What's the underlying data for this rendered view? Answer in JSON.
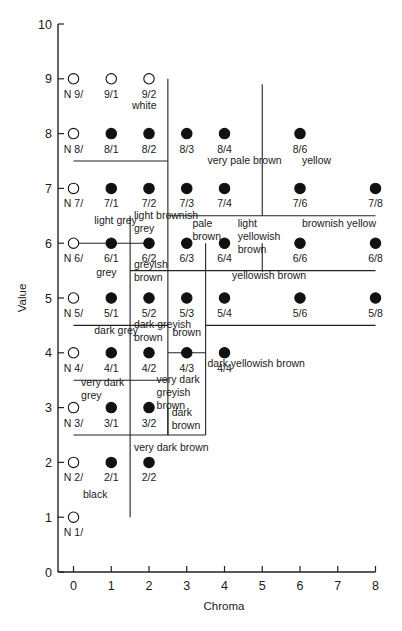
{
  "chart_data": {
    "type": "scatter",
    "title": "",
    "xlabel": "Chroma",
    "ylabel": "Value",
    "xlim": [
      0,
      8
    ],
    "ylim": [
      0,
      10
    ],
    "x_ticks": [
      0,
      1,
      2,
      3,
      4,
      5,
      6,
      7,
      8
    ],
    "y_ticks": [
      0,
      1,
      2,
      3,
      4,
      5,
      6,
      7,
      8,
      9,
      10
    ],
    "grid": false,
    "legend": null,
    "points": [
      {
        "label": "N 9/",
        "chroma": 0,
        "value": 9,
        "filled": false
      },
      {
        "label": "9/1",
        "chroma": 1,
        "value": 9,
        "filled": false
      },
      {
        "label": "9/2",
        "chroma": 2,
        "value": 9,
        "filled": false
      },
      {
        "label": "N 8/",
        "chroma": 0,
        "value": 8,
        "filled": false
      },
      {
        "label": "8/1",
        "chroma": 1,
        "value": 8,
        "filled": true
      },
      {
        "label": "8/2",
        "chroma": 2,
        "value": 8,
        "filled": true
      },
      {
        "label": "8/3",
        "chroma": 3,
        "value": 8,
        "filled": true
      },
      {
        "label": "8/4",
        "chroma": 4,
        "value": 8,
        "filled": true
      },
      {
        "label": "8/6",
        "chroma": 6,
        "value": 8,
        "filled": true
      },
      {
        "label": "N 7/",
        "chroma": 0,
        "value": 7,
        "filled": false
      },
      {
        "label": "7/1",
        "chroma": 1,
        "value": 7,
        "filled": true
      },
      {
        "label": "7/2",
        "chroma": 2,
        "value": 7,
        "filled": true
      },
      {
        "label": "7/3",
        "chroma": 3,
        "value": 7,
        "filled": true
      },
      {
        "label": "7/4",
        "chroma": 4,
        "value": 7,
        "filled": true
      },
      {
        "label": "7/6",
        "chroma": 6,
        "value": 7,
        "filled": true
      },
      {
        "label": "7/8",
        "chroma": 8,
        "value": 7,
        "filled": true
      },
      {
        "label": "N 6/",
        "chroma": 0,
        "value": 6,
        "filled": false
      },
      {
        "label": "6/1",
        "chroma": 1,
        "value": 6,
        "filled": true
      },
      {
        "label": "6/2",
        "chroma": 2,
        "value": 6,
        "filled": true
      },
      {
        "label": "6/3",
        "chroma": 3,
        "value": 6,
        "filled": true
      },
      {
        "label": "6/4",
        "chroma": 4,
        "value": 6,
        "filled": true
      },
      {
        "label": "6/6",
        "chroma": 6,
        "value": 6,
        "filled": true
      },
      {
        "label": "6/8",
        "chroma": 8,
        "value": 6,
        "filled": true
      },
      {
        "label": "N 5/",
        "chroma": 0,
        "value": 5,
        "filled": false
      },
      {
        "label": "5/1",
        "chroma": 1,
        "value": 5,
        "filled": true
      },
      {
        "label": "5/2",
        "chroma": 2,
        "value": 5,
        "filled": true
      },
      {
        "label": "5/3",
        "chroma": 3,
        "value": 5,
        "filled": true
      },
      {
        "label": "5/4",
        "chroma": 4,
        "value": 5,
        "filled": true
      },
      {
        "label": "5/6",
        "chroma": 6,
        "value": 5,
        "filled": true
      },
      {
        "label": "5/8",
        "chroma": 8,
        "value": 5,
        "filled": true
      },
      {
        "label": "N 4/",
        "chroma": 0,
        "value": 4,
        "filled": false
      },
      {
        "label": "4/1",
        "chroma": 1,
        "value": 4,
        "filled": true
      },
      {
        "label": "4/2",
        "chroma": 2,
        "value": 4,
        "filled": true
      },
      {
        "label": "4/3",
        "chroma": 3,
        "value": 4,
        "filled": true
      },
      {
        "label": "4/4",
        "chroma": 4,
        "value": 4,
        "filled": true
      },
      {
        "label": "N 3/",
        "chroma": 0,
        "value": 3,
        "filled": false
      },
      {
        "label": "3/1",
        "chroma": 1,
        "value": 3,
        "filled": true
      },
      {
        "label": "3/2",
        "chroma": 2,
        "value": 3,
        "filled": true
      },
      {
        "label": "N 2/",
        "chroma": 0,
        "value": 2,
        "filled": false
      },
      {
        "label": "2/1",
        "chroma": 1,
        "value": 2,
        "filled": true
      },
      {
        "label": "2/2",
        "chroma": 2,
        "value": 2,
        "filled": true
      },
      {
        "label": "N 1/",
        "chroma": 0,
        "value": 1,
        "filled": false
      }
    ],
    "region_labels": [
      {
        "lines": [
          "white"
        ],
        "chroma": 1.55,
        "value": 8.45
      },
      {
        "lines": [
          "very pale brown"
        ],
        "chroma": 3.55,
        "value": 7.45
      },
      {
        "lines": [
          "yellow"
        ],
        "chroma": 6.05,
        "value": 7.45
      },
      {
        "lines": [
          "light grey"
        ],
        "chroma": 0.55,
        "value": 6.35
      },
      {
        "lines": [
          "light brownish",
          "grey"
        ],
        "chroma": 1.6,
        "value": 6.45
      },
      {
        "lines": [
          "pale",
          "brown"
        ],
        "chroma": 3.15,
        "value": 6.3
      },
      {
        "lines": [
          "light",
          "yellowish",
          "brown"
        ],
        "chroma": 4.35,
        "value": 6.3
      },
      {
        "lines": [
          "brownish yellow"
        ],
        "chroma": 6.05,
        "value": 6.3
      },
      {
        "lines": [
          "grey"
        ],
        "chroma": 0.6,
        "value": 5.4
      },
      {
        "lines": [
          "greyish",
          "brown"
        ],
        "chroma": 1.6,
        "value": 5.55
      },
      {
        "lines": [
          "yellowish brown"
        ],
        "chroma": 4.2,
        "value": 5.35
      },
      {
        "lines": [
          "dark grey"
        ],
        "chroma": 0.55,
        "value": 4.35
      },
      {
        "lines": [
          "dark greyish",
          "brown"
        ],
        "chroma": 1.6,
        "value": 4.45
      },
      {
        "lines": [
          "brown"
        ],
        "chroma": 2.62,
        "value": 4.3
      },
      {
        "lines": [
          "dark yellowish brown"
        ],
        "chroma": 3.55,
        "value": 3.75
      },
      {
        "lines": [
          "very dark",
          "grey"
        ],
        "chroma": 0.2,
        "value": 3.4
      },
      {
        "lines": [
          "very dark",
          "greyish",
          "brown"
        ],
        "chroma": 2.2,
        "value": 3.45
      },
      {
        "lines": [
          "dark",
          "brown"
        ],
        "chroma": 2.6,
        "value": 2.85
      },
      {
        "lines": [
          "very dark brown"
        ],
        "chroma": 1.6,
        "value": 2.2
      },
      {
        "lines": [
          "black"
        ],
        "chroma": 0.25,
        "value": 1.35
      }
    ],
    "boundary_lines": [
      {
        "from": [
          2.5,
          9.0
        ],
        "to": [
          2.5,
          2.5
        ]
      },
      {
        "from": [
          1.5,
          6.0
        ],
        "to": [
          1.5,
          1.0
        ]
      },
      {
        "from": [
          0.0,
          7.5
        ],
        "to": [
          2.5,
          7.5
        ]
      },
      {
        "from": [
          5.0,
          8.9
        ],
        "to": [
          5.0,
          6.5
        ]
      },
      {
        "from": [
          2.5,
          6.5
        ],
        "to": [
          8.0,
          6.5
        ]
      },
      {
        "from": [
          0.0,
          6.0
        ],
        "to": [
          2.0,
          6.0
        ]
      },
      {
        "from": [
          1.5,
          6.0
        ],
        "to": [
          1.5,
          6.5
        ]
      },
      {
        "from": [
          3.5,
          6.0
        ],
        "to": [
          3.5,
          2.5
        ]
      },
      {
        "from": [
          5.0,
          6.0
        ],
        "to": [
          5.0,
          5.5
        ]
      },
      {
        "from": [
          1.5,
          5.5
        ],
        "to": [
          8.0,
          5.5
        ]
      },
      {
        "from": [
          0.0,
          4.5
        ],
        "to": [
          2.5,
          4.5
        ]
      },
      {
        "from": [
          3.5,
          4.5
        ],
        "to": [
          8.0,
          4.5
        ]
      },
      {
        "from": [
          2.5,
          4.0
        ],
        "to": [
          3.5,
          4.0
        ]
      },
      {
        "from": [
          0.0,
          3.5
        ],
        "to": [
          2.5,
          3.5
        ]
      },
      {
        "from": [
          2.5,
          3.0
        ],
        "to": [
          2.5,
          2.5
        ]
      },
      {
        "from": [
          0.0,
          2.5
        ],
        "to": [
          3.5,
          2.5
        ]
      }
    ]
  }
}
